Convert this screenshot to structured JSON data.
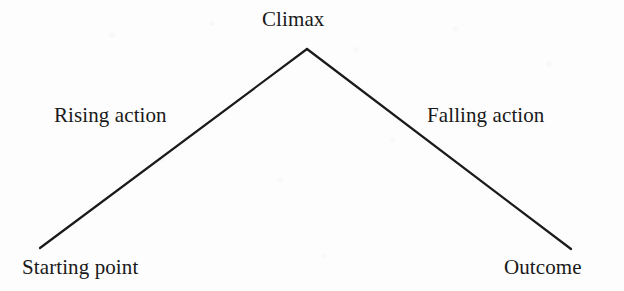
{
  "diagram": {
    "type": "story-arc",
    "background_color": "#fdfdfd",
    "line_color": "#1a1a1a",
    "text_color": "#191919",
    "line_width": 2,
    "labels": {
      "climax": "Climax",
      "rising_action": "Rising action",
      "falling_action": "Falling action",
      "starting_point": "Starting point",
      "outcome": "Outcome"
    },
    "points": {
      "start": {
        "x": 40,
        "y": 248
      },
      "apex": {
        "x": 307,
        "y": 49
      },
      "end": {
        "x": 571,
        "y": 249
      }
    },
    "segments": [
      {
        "name": "rising-action-line",
        "from": "start",
        "to": "apex"
      },
      {
        "name": "falling-action-line",
        "from": "apex",
        "to": "end"
      }
    ]
  }
}
